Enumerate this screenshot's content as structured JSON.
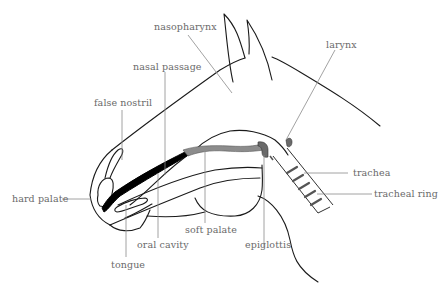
{
  "diagram": {
    "colors": {
      "outline": "#1a1a1a",
      "leader": "#8a8a8a",
      "label": "#6a6a6a",
      "soft_palate_fill": "#8c8c8c",
      "hard_palate_fill": "#000000"
    },
    "labels": {
      "nasopharynx": "nasopharynx",
      "nasal_passage": "nasal passage",
      "false_nostril": "false nostril",
      "larynx": "larynx",
      "hard_palate": "hard palate",
      "trachea": "trachea",
      "tracheal_ring": "tracheal ring",
      "soft_palate": "soft palate",
      "epiglottis": "epiglottis",
      "oral_cavity": "oral cavity",
      "tongue": "tongue"
    }
  }
}
